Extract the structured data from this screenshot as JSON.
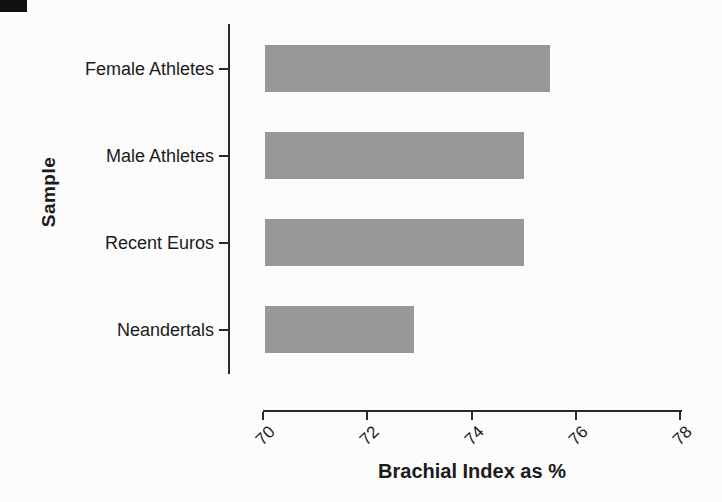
{
  "chart_data": {
    "type": "bar",
    "orientation": "horizontal",
    "title": "",
    "xlabel": "Brachial Index as %",
    "ylabel": "Sample",
    "categories": [
      "Female Athletes",
      "Male Athletes",
      "Recent Euros",
      "Neandertals"
    ],
    "values": [
      75.5,
      75.0,
      75.0,
      72.9
    ],
    "xlim": [
      70,
      78
    ],
    "xticks": [
      "70",
      "72",
      "74",
      "76",
      "78"
    ],
    "grid": false,
    "legend": "none"
  },
  "style": {
    "background": "#fcfcfc",
    "bar_color": "#989898",
    "axis_color": "#2a2a2a",
    "text_color": "#1b1b1b",
    "corner_mark_color": "#111111"
  }
}
